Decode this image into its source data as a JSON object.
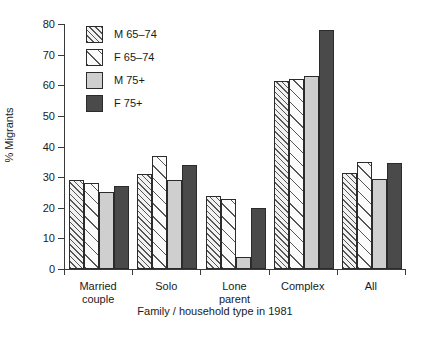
{
  "chart_data": {
    "type": "bar",
    "title": "",
    "xlabel": "Family / household type in 1981",
    "ylabel": "% Migrants",
    "ylim": [
      0,
      80
    ],
    "yticks": [
      0,
      10,
      20,
      30,
      40,
      50,
      60,
      70,
      80
    ],
    "grid": false,
    "legend_position": "top-left",
    "categories": [
      "Married couple",
      "Solo",
      "Lone parent",
      "Complex",
      "All"
    ],
    "category_lines": [
      [
        "Married",
        "couple"
      ],
      [
        "Solo"
      ],
      [
        "Lone",
        "parent"
      ],
      [
        "Complex"
      ],
      [
        "All"
      ]
    ],
    "series": [
      {
        "name": "M 65–74",
        "pattern": "dense-diagonal-hatch",
        "color": "#f2f2f2",
        "values": [
          29,
          31,
          24,
          61.5,
          31.5
        ]
      },
      {
        "name": "F 65–74",
        "pattern": "sparse-diagonal-hatch",
        "color": "#fbfbfb",
        "values": [
          28,
          37,
          23,
          62,
          35
        ]
      },
      {
        "name": "M 75+",
        "pattern": "solid",
        "color": "#cfcfcf",
        "values": [
          25,
          29,
          4,
          63,
          29.5
        ]
      },
      {
        "name": "F 75+",
        "pattern": "solid",
        "color": "#4a4a4a",
        "values": [
          27,
          34,
          20,
          78,
          34.5
        ]
      }
    ]
  },
  "axis": {
    "y_label": "% Migrants",
    "x_label": "Family / household type in 1981",
    "y_tick_labels": [
      "80",
      "70",
      "60",
      "50",
      "40",
      "30",
      "20",
      "10",
      "0"
    ]
  },
  "legend": {
    "items": [
      {
        "label": "M 65–74"
      },
      {
        "label": "F 65–74"
      },
      {
        "label": "M 75+"
      },
      {
        "label": "F 75+"
      }
    ]
  }
}
